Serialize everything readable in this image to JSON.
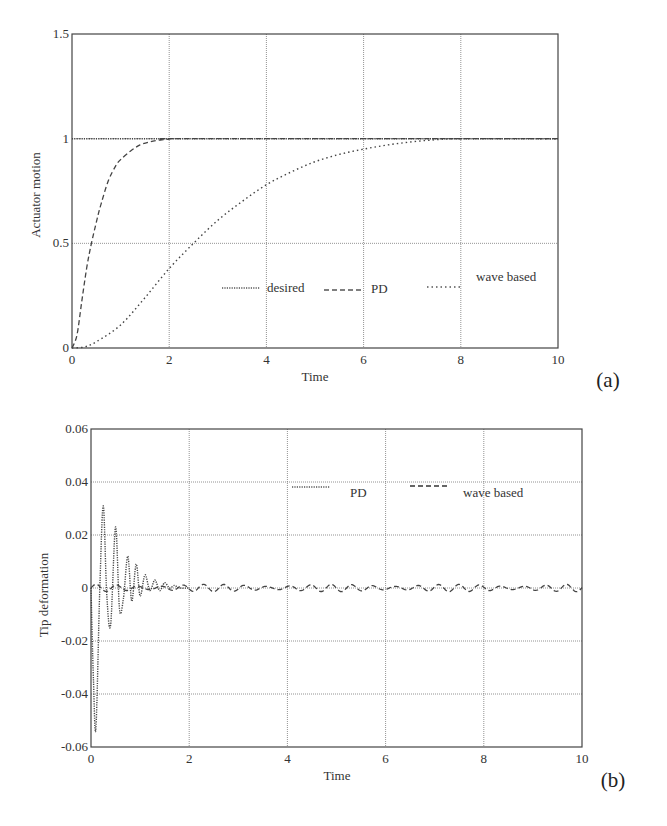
{
  "chart_data": [
    {
      "id": "a",
      "type": "line",
      "panel_label": "(a)",
      "title": "",
      "xlabel": "Time",
      "ylabel": "Actuator motion",
      "xlim": [
        0,
        10
      ],
      "ylim": [
        0,
        1.5
      ],
      "xticks": [
        "0",
        "2",
        "4",
        "6",
        "8",
        "10"
      ],
      "yticks": [
        "0",
        "0.5",
        "1",
        "1.5"
      ],
      "grid": true,
      "legend": [
        "desired",
        "PD",
        "wave based"
      ],
      "series": [
        {
          "name": "desired",
          "style": "dotted",
          "x": [
            0,
            10
          ],
          "y": [
            1,
            1
          ]
        },
        {
          "name": "PD",
          "style": "dashed",
          "x": [
            0,
            0.1,
            0.2,
            0.3,
            0.4,
            0.5,
            0.6,
            0.75,
            0.9,
            1.0,
            1.2,
            1.4,
            1.6,
            1.8,
            2.0,
            2.5,
            10
          ],
          "y": [
            0,
            0.06,
            0.22,
            0.38,
            0.5,
            0.6,
            0.69,
            0.8,
            0.87,
            0.9,
            0.94,
            0.97,
            0.985,
            0.993,
            0.998,
            1.0,
            1.0
          ]
        },
        {
          "name": "wave based",
          "style": "dotted",
          "x": [
            0,
            0.25,
            0.5,
            1,
            1.5,
            2,
            2.5,
            3,
            3.5,
            4,
            4.5,
            5,
            5.5,
            6,
            6.5,
            7,
            7.5,
            8,
            10
          ],
          "y": [
            0,
            0.005,
            0.03,
            0.11,
            0.24,
            0.38,
            0.5,
            0.61,
            0.7,
            0.78,
            0.84,
            0.89,
            0.925,
            0.95,
            0.97,
            0.985,
            0.995,
            1.0,
            1.0
          ]
        }
      ]
    },
    {
      "id": "b",
      "type": "line",
      "panel_label": "(b)",
      "title": "",
      "xlabel": "Time",
      "ylabel": "Tip deformation",
      "xlim": [
        0,
        10
      ],
      "ylim": [
        -0.06,
        0.06
      ],
      "xticks": [
        "0",
        "2",
        "4",
        "6",
        "8",
        "10"
      ],
      "yticks": [
        "-0.06",
        "-0.04",
        "-0.02",
        "0",
        "0.02",
        "0.04",
        "0.06"
      ],
      "grid": true,
      "legend": [
        "PD",
        "wave based"
      ],
      "series": [
        {
          "name": "PD",
          "style": "dotted",
          "x": [
            0,
            0.05,
            0.1,
            0.18,
            0.25,
            0.32,
            0.4,
            0.5,
            0.58,
            0.66,
            0.75,
            0.83,
            0.92,
            1.0,
            1.1,
            1.2,
            1.3,
            1.4,
            1.5,
            1.6,
            1.7,
            1.8,
            2.0
          ],
          "y": [
            0,
            -0.035,
            -0.053,
            0.0,
            0.031,
            -0.002,
            -0.014,
            0.023,
            -0.008,
            -0.004,
            0.012,
            -0.005,
            0.009,
            -0.003,
            0.005,
            -0.001,
            0.003,
            -0.001,
            0.002,
            0.0,
            0.001,
            0.0,
            0.0
          ]
        },
        {
          "name": "wave based",
          "style": "dashed",
          "x_range": [
            0,
            10
          ],
          "description": "small persistent oscillation about 0 with amplitude ~0.001",
          "amplitude": 0.001,
          "center": 0.0
        }
      ]
    }
  ]
}
